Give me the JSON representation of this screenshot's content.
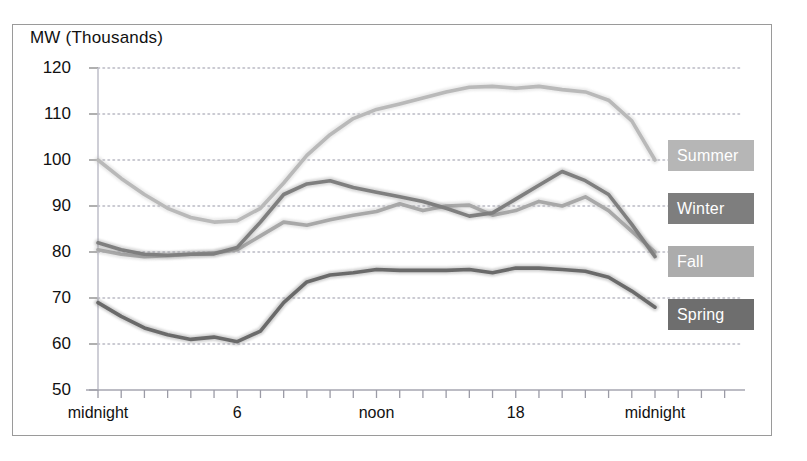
{
  "chart_data": {
    "type": "line",
    "title": "",
    "ylabel": "MW (Thousands)",
    "xlabel": "",
    "ylim": [
      50,
      120
    ],
    "ytick_values": [
      50,
      60,
      70,
      80,
      90,
      100,
      110,
      120
    ],
    "ytick_labels": [
      "50",
      "60",
      "70",
      "80",
      "90",
      "100",
      "110",
      "120"
    ],
    "grid": true,
    "grid_style": "dotted",
    "xlim": [
      0,
      24
    ],
    "x": [
      0,
      1,
      2,
      3,
      4,
      5,
      6,
      7,
      8,
      9,
      10,
      11,
      12,
      13,
      14,
      15,
      16,
      17,
      18,
      19,
      20,
      21,
      22,
      23,
      24
    ],
    "xtick_positions": [
      0,
      6,
      12,
      18,
      24
    ],
    "xtick_labels": [
      "midnight",
      "6",
      "noon",
      "18",
      "midnight"
    ],
    "xtick_minor_step_hours": 1,
    "legend_position": "right-outside",
    "series": [
      {
        "name": "Summer",
        "color": "#b9b9b9",
        "values": [
          100.0,
          96.0,
          92.5,
          89.5,
          87.5,
          86.5,
          86.8,
          89.5,
          95.0,
          101.0,
          105.5,
          109.0,
          111.0,
          112.2,
          113.5,
          114.8,
          115.8,
          116.0,
          115.6,
          116.0,
          115.3,
          114.8,
          113.0,
          108.5,
          100.0
        ]
      },
      {
        "name": "Winter",
        "color": "#7f7f7f",
        "values": [
          82.0,
          80.5,
          79.5,
          79.3,
          79.5,
          79.6,
          81.0,
          86.5,
          92.5,
          94.8,
          95.5,
          94.0,
          93.0,
          92.0,
          91.0,
          89.5,
          87.8,
          88.5,
          91.5,
          94.5,
          97.5,
          95.5,
          92.5,
          86.0,
          79.0
        ]
      },
      {
        "name": "Fall",
        "color": "#a8a8a8",
        "values": [
          80.5,
          79.5,
          79.0,
          79.2,
          79.5,
          79.8,
          80.5,
          83.5,
          86.5,
          85.8,
          87.0,
          88.0,
          88.8,
          90.5,
          89.0,
          90.0,
          90.2,
          88.0,
          89.0,
          91.0,
          90.0,
          92.0,
          89.0,
          84.5,
          80.0
        ]
      },
      {
        "name": "Spring",
        "color": "#6b6b6b",
        "values": [
          69.0,
          66.0,
          63.5,
          62.0,
          61.0,
          61.5,
          60.5,
          62.8,
          69.0,
          73.5,
          75.0,
          75.5,
          76.2,
          76.0,
          76.0,
          76.0,
          76.2,
          75.5,
          76.5,
          76.5,
          76.2,
          75.8,
          74.5,
          71.5,
          68.0
        ]
      }
    ]
  },
  "legend": {
    "items": [
      {
        "label": "Summer",
        "color": "#b6b6b6"
      },
      {
        "label": "Winter",
        "color": "#7e7e7e"
      },
      {
        "label": "Fall",
        "color": "#acacac"
      },
      {
        "label": "Spring",
        "color": "#6e6e6e"
      }
    ]
  }
}
